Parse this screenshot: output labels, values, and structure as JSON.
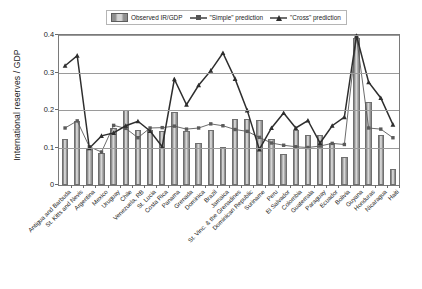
{
  "chart_data": {
    "type": "bar",
    "title": "",
    "xlabel": "",
    "ylabel": "International reserves / GDP",
    "ylim": [
      0,
      0.4
    ],
    "yticks": [
      0,
      0.1,
      0.2,
      0.3,
      0.4
    ],
    "ytick_labels": [
      "0",
      "0.1",
      "0.2",
      "0.3",
      "0.4"
    ],
    "grid": true,
    "legend_position": "top-center",
    "categories": [
      "Antigua and Barbuda",
      "St. Kitts and Nevis",
      "Argentina",
      "Mexico",
      "Uruguay",
      "Chile",
      "Venezuela, RB",
      "St. Lucia",
      "Costa Rica",
      "Panama",
      "Grenada",
      "Dominica",
      "Brazil",
      "Jamaica",
      "St. Vinc. & the Grenadines",
      "Dominican Republic",
      "Suriname",
      "Peru",
      "El Salvador",
      "Colombia",
      "Guatemala",
      "Paraguay",
      "Ecuador",
      "Bolivia",
      "Guyana",
      "Honduras",
      "Nicaragua",
      "Haiti"
    ],
    "series": [
      {
        "name": "Observed IR/GDP",
        "type": "bar",
        "color": "#b4b4b4",
        "values": [
          0.124,
          0.171,
          0.098,
          0.085,
          0.151,
          0.199,
          0.148,
          0.146,
          0.143,
          0.195,
          0.144,
          0.112,
          0.147,
          0.101,
          0.176,
          0.175,
          0.173,
          0.124,
          0.084,
          0.146,
          0.134,
          0.133,
          0.112,
          0.074,
          0.393,
          0.222,
          0.134,
          0.044
        ]
      },
      {
        "name": "\"Simple\" prediction",
        "type": "line",
        "marker": "square",
        "color": "#5a5a5a",
        "values": [
          0.152,
          0.171,
          0.102,
          0.088,
          0.159,
          0.151,
          0.126,
          0.152,
          0.153,
          0.157,
          0.149,
          0.152,
          0.163,
          0.158,
          0.148,
          0.143,
          0.127,
          0.112,
          0.106,
          0.102,
          0.1,
          0.104,
          0.111,
          0.108,
          0.396,
          0.152,
          0.149,
          0.126
        ]
      },
      {
        "name": "\"Cross\" prediction",
        "type": "line",
        "marker": "triangle",
        "color": "#2e2e2e",
        "values": [
          0.318,
          0.345,
          0.098,
          0.131,
          0.139,
          0.158,
          0.17,
          0.144,
          0.102,
          0.282,
          0.214,
          0.266,
          0.305,
          0.352,
          0.283,
          0.199,
          0.095,
          0.152,
          0.192,
          0.152,
          0.172,
          0.112,
          0.158,
          0.181,
          0.398,
          0.274,
          0.232,
          0.161
        ]
      }
    ]
  },
  "legend": {
    "items": [
      {
        "label": "Observed IR/GDP",
        "marker": "bar-swatch"
      },
      {
        "label": "\"Simple\" prediction",
        "marker": "square-marker"
      },
      {
        "label": "\"Cross\" prediction",
        "marker": "triangle-marker"
      }
    ]
  }
}
